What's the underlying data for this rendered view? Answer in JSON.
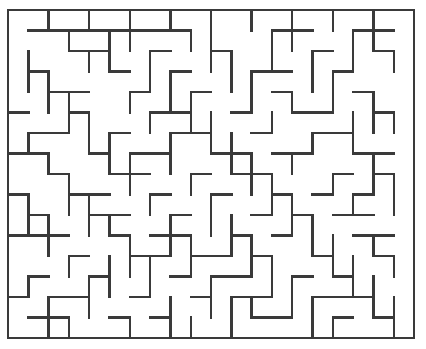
{
  "figure": {
    "kind": "maze-puzzle",
    "caption": "",
    "background_color": "#ffffff",
    "wall_color": "#3a3a3a",
    "wall_thickness_px": 2.4,
    "border_thickness_px": 2.6
  },
  "chart_data": {
    "type": "diagram",
    "subtype": "maze",
    "grid": {
      "columns": 20,
      "rows": 16,
      "cell_width_px": 20.3,
      "cell_height_px": 20.5,
      "origin_x_px": 8,
      "origin_y_px": 10,
      "width_px": 406,
      "height_px": 328
    },
    "legend": [],
    "annotations": [],
    "border": {
      "top": true,
      "right": true,
      "bottom": true,
      "left": true,
      "openings": []
    },
    "horizontal_walls": [
      [
        0,
        0,
        20
      ],
      [
        1,
        1,
        9
      ],
      [
        1,
        13,
        15
      ],
      [
        1,
        17,
        19
      ],
      [
        2,
        3,
        5
      ],
      [
        2,
        7,
        8
      ],
      [
        2,
        10,
        11
      ],
      [
        2,
        15,
        16
      ],
      [
        2,
        18,
        19
      ],
      [
        3,
        1,
        2
      ],
      [
        3,
        5,
        6
      ],
      [
        3,
        8,
        9
      ],
      [
        3,
        12,
        14
      ],
      [
        3,
        16,
        17
      ],
      [
        4,
        2,
        4
      ],
      [
        4,
        6,
        7
      ],
      [
        4,
        9,
        10
      ],
      [
        4,
        13,
        14
      ],
      [
        4,
        17,
        18
      ],
      [
        5,
        0,
        1
      ],
      [
        5,
        3,
        4
      ],
      [
        5,
        7,
        9
      ],
      [
        5,
        11,
        12
      ],
      [
        5,
        14,
        16
      ],
      [
        5,
        18,
        19
      ],
      [
        6,
        1,
        3
      ],
      [
        6,
        5,
        6
      ],
      [
        6,
        8,
        10
      ],
      [
        6,
        12,
        13
      ],
      [
        6,
        15,
        17
      ],
      [
        7,
        0,
        2
      ],
      [
        7,
        4,
        5
      ],
      [
        7,
        6,
        8
      ],
      [
        7,
        10,
        12
      ],
      [
        7,
        13,
        15
      ],
      [
        7,
        17,
        19
      ],
      [
        8,
        2,
        3
      ],
      [
        8,
        5,
        7
      ],
      [
        8,
        9,
        10
      ],
      [
        8,
        11,
        13
      ],
      [
        8,
        16,
        17
      ],
      [
        8,
        18,
        19
      ],
      [
        9,
        0,
        1
      ],
      [
        9,
        3,
        5
      ],
      [
        9,
        7,
        8
      ],
      [
        9,
        10,
        11
      ],
      [
        9,
        13,
        14
      ],
      [
        9,
        15,
        16
      ],
      [
        9,
        17,
        18
      ],
      [
        10,
        1,
        2
      ],
      [
        10,
        4,
        6
      ],
      [
        10,
        8,
        9
      ],
      [
        10,
        12,
        13
      ],
      [
        10,
        14,
        15
      ],
      [
        10,
        16,
        18
      ],
      [
        11,
        0,
        3
      ],
      [
        11,
        5,
        6
      ],
      [
        11,
        7,
        9
      ],
      [
        11,
        11,
        12
      ],
      [
        11,
        13,
        14
      ],
      [
        11,
        17,
        19
      ],
      [
        12,
        3,
        4
      ],
      [
        12,
        6,
        8
      ],
      [
        12,
        9,
        11
      ],
      [
        12,
        12,
        13
      ],
      [
        12,
        15,
        16
      ],
      [
        12,
        18,
        19
      ],
      [
        13,
        1,
        2
      ],
      [
        13,
        4,
        5
      ],
      [
        13,
        8,
        9
      ],
      [
        13,
        10,
        12
      ],
      [
        13,
        14,
        15
      ],
      [
        13,
        16,
        17
      ],
      [
        14,
        0,
        1
      ],
      [
        14,
        2,
        4
      ],
      [
        14,
        6,
        7
      ],
      [
        14,
        9,
        10
      ],
      [
        14,
        11,
        13
      ],
      [
        14,
        15,
        18
      ],
      [
        15,
        1,
        3
      ],
      [
        15,
        5,
        6
      ],
      [
        15,
        7,
        8
      ],
      [
        15,
        12,
        14
      ],
      [
        15,
        16,
        17
      ],
      [
        15,
        18,
        19
      ],
      [
        16,
        0,
        20
      ]
    ],
    "vertical_walls": [
      [
        0,
        0,
        16
      ],
      [
        0,
        1,
        3
      ],
      [
        0,
        4,
        6
      ],
      [
        0,
        8,
        9
      ],
      [
        0,
        11,
        12
      ],
      [
        0,
        14,
        15
      ],
      [
        1,
        2,
        4
      ],
      [
        1,
        6,
        7
      ],
      [
        1,
        9,
        11
      ],
      [
        1,
        13,
        14
      ],
      [
        2,
        0,
        1
      ],
      [
        2,
        3,
        5
      ],
      [
        2,
        7,
        8
      ],
      [
        2,
        10,
        12
      ],
      [
        2,
        14,
        16
      ],
      [
        3,
        1,
        2
      ],
      [
        3,
        4,
        6
      ],
      [
        3,
        8,
        10
      ],
      [
        3,
        12,
        13
      ],
      [
        3,
        15,
        16
      ],
      [
        4,
        0,
        1
      ],
      [
        4,
        2,
        3
      ],
      [
        4,
        5,
        7
      ],
      [
        4,
        9,
        11
      ],
      [
        4,
        13,
        15
      ],
      [
        5,
        1,
        3
      ],
      [
        5,
        6,
        8
      ],
      [
        5,
        10,
        11
      ],
      [
        5,
        12,
        14
      ],
      [
        6,
        0,
        2
      ],
      [
        6,
        4,
        5
      ],
      [
        6,
        7,
        9
      ],
      [
        6,
        11,
        13
      ],
      [
        6,
        15,
        16
      ],
      [
        7,
        2,
        4
      ],
      [
        7,
        5,
        6
      ],
      [
        7,
        9,
        10
      ],
      [
        7,
        12,
        14
      ],
      [
        8,
        0,
        1
      ],
      [
        8,
        3,
        5
      ],
      [
        8,
        6,
        8
      ],
      [
        8,
        10,
        12
      ],
      [
        8,
        14,
        16
      ],
      [
        9,
        1,
        2
      ],
      [
        9,
        4,
        6
      ],
      [
        9,
        8,
        9
      ],
      [
        9,
        11,
        13
      ],
      [
        9,
        15,
        16
      ],
      [
        10,
        0,
        3
      ],
      [
        10,
        5,
        7
      ],
      [
        10,
        9,
        11
      ],
      [
        10,
        13,
        15
      ],
      [
        11,
        2,
        4
      ],
      [
        11,
        6,
        8
      ],
      [
        11,
        10,
        12
      ],
      [
        11,
        14,
        16
      ],
      [
        12,
        0,
        1
      ],
      [
        12,
        3,
        5
      ],
      [
        12,
        7,
        9
      ],
      [
        12,
        11,
        13
      ],
      [
        12,
        14,
        15
      ],
      [
        13,
        1,
        3
      ],
      [
        13,
        5,
        6
      ],
      [
        13,
        8,
        10
      ],
      [
        13,
        12,
        14
      ],
      [
        14,
        0,
        2
      ],
      [
        14,
        4,
        5
      ],
      [
        14,
        7,
        8
      ],
      [
        14,
        9,
        11
      ],
      [
        14,
        13,
        15
      ],
      [
        15,
        2,
        4
      ],
      [
        15,
        6,
        7
      ],
      [
        15,
        10,
        12
      ],
      [
        15,
        14,
        16
      ],
      [
        16,
        0,
        1
      ],
      [
        16,
        3,
        5
      ],
      [
        16,
        8,
        9
      ],
      [
        16,
        11,
        13
      ],
      [
        16,
        15,
        16
      ],
      [
        17,
        1,
        3
      ],
      [
        17,
        5,
        7
      ],
      [
        17,
        9,
        10
      ],
      [
        17,
        12,
        14
      ],
      [
        18,
        0,
        2
      ],
      [
        18,
        4,
        6
      ],
      [
        18,
        7,
        9
      ],
      [
        18,
        11,
        12
      ],
      [
        18,
        13,
        15
      ],
      [
        19,
        2,
        3
      ],
      [
        19,
        5,
        6
      ],
      [
        19,
        8,
        10
      ],
      [
        19,
        12,
        13
      ],
      [
        19,
        14,
        16
      ],
      [
        20,
        0,
        16
      ]
    ]
  }
}
